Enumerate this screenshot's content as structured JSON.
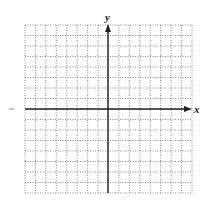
{
  "figure": {
    "type": "coordinate-grid",
    "x_axis_label": "x",
    "y_axis_label": "y",
    "grid": {
      "columns": 16,
      "rows": 16,
      "columns_left_of_y_axis": 8,
      "rows_above_x_axis": 8,
      "line_style": "dotted",
      "grid_color": "#555555",
      "axis_color": "#222222"
    },
    "stray_mark": "~"
  }
}
